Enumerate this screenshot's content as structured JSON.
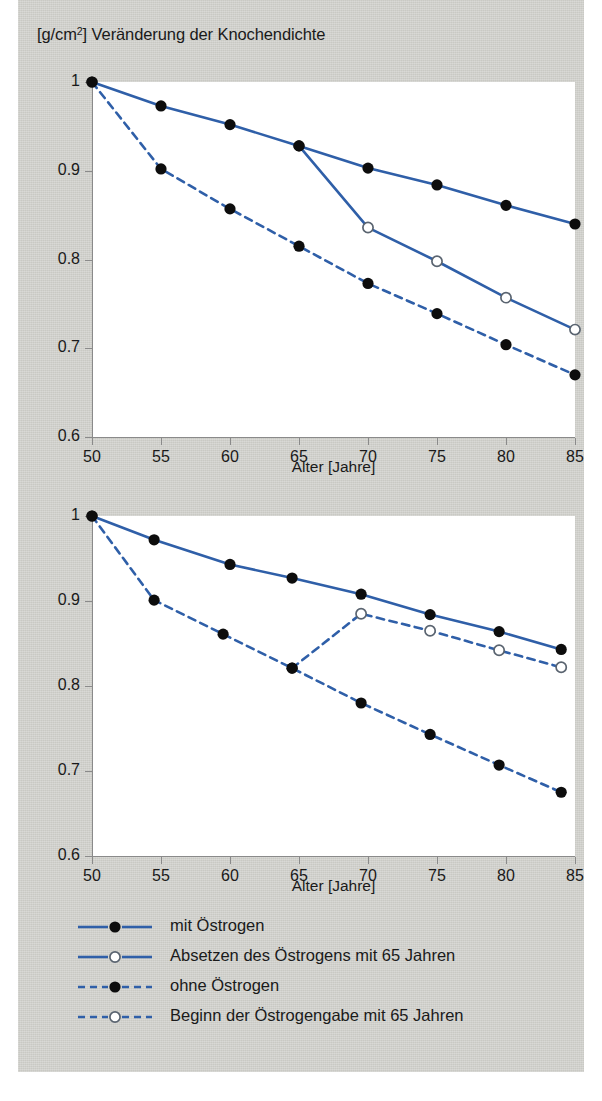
{
  "figure": {
    "title_prefix": "[g/cm",
    "title_sup": "2",
    "title_suffix": "] Veränderung der Knochendichte",
    "title_full": "[g/cm2] Veränderung der Knochendichte",
    "line_color": "#2f5fa8",
    "marker_fill_color": "#0d0d0d",
    "marker_open_color": "#ffffff",
    "panel_background": "#cdcdc8",
    "plot_background": "#ffffff",
    "axis_color": "#8a8a8a"
  },
  "legend": {
    "items": [
      {
        "label": "mit Östrogen",
        "style": "solid",
        "marker": "filled"
      },
      {
        "label": "Absetzen des Östrogens mit 65 Jahren",
        "style": "solid",
        "marker": "open"
      },
      {
        "label": "ohne Östrogen",
        "style": "dashed",
        "marker": "filled"
      },
      {
        "label": "Beginn der Östrogengabe mit 65 Jahren",
        "style": "dashed",
        "marker": "open"
      }
    ]
  },
  "chart_data": [
    {
      "id": "chart-top",
      "type": "line",
      "title": "[g/cm2] Veränderung der Knochendichte",
      "xlabel": "Alter [Jahre]",
      "ylabel": "[g/cm2]",
      "xlim": [
        50,
        85
      ],
      "ylim": [
        0.6,
        1.0
      ],
      "xticks": [
        50,
        55,
        60,
        65,
        70,
        75,
        80,
        85
      ],
      "xticklabels": [
        "50",
        "55",
        "60",
        "65",
        "70",
        "75",
        "80",
        "85"
      ],
      "yticks": [
        0.6,
        0.7,
        0.8,
        0.9,
        1.0
      ],
      "yticklabels": [
        "0.6",
        "0.7",
        "0.8",
        "0.9",
        "1"
      ],
      "grid": false,
      "legend_position": "below-figure",
      "series": [
        {
          "name": "mit Östrogen",
          "style": "solid",
          "marker": "filled",
          "x": [
            50,
            55,
            60,
            65,
            70,
            75,
            80,
            85
          ],
          "values": [
            1.0,
            0.973,
            0.952,
            0.928,
            0.903,
            0.884,
            0.861,
            0.84
          ]
        },
        {
          "name": "Absetzen des Östrogens mit 65 Jahren",
          "style": "solid",
          "marker": "open",
          "x": [
            65,
            70,
            75,
            80,
            85
          ],
          "values": [
            0.928,
            0.836,
            0.798,
            0.757,
            0.721
          ],
          "first_point_marker": "shared-filled"
        },
        {
          "name": "ohne Östrogen",
          "style": "dashed",
          "marker": "filled",
          "x": [
            50,
            55,
            60,
            65,
            70,
            75,
            80,
            85
          ],
          "values": [
            1.0,
            0.902,
            0.857,
            0.815,
            0.773,
            0.739,
            0.704,
            0.67
          ]
        }
      ]
    },
    {
      "id": "chart-bottom",
      "type": "line",
      "title": "",
      "xlabel": "Alter [Jahre]",
      "ylabel": "[g/cm2]",
      "xlim": [
        50,
        85
      ],
      "ylim": [
        0.6,
        1.0
      ],
      "xticks": [
        50,
        55,
        60,
        65,
        70,
        75,
        80,
        85
      ],
      "xticklabels": [
        "50",
        "55",
        "60",
        "65",
        "70",
        "75",
        "80",
        "85"
      ],
      "yticks": [
        0.6,
        0.7,
        0.8,
        0.9,
        1.0
      ],
      "yticklabels": [
        "0.6",
        "0.7",
        "0.8",
        "0.9",
        "1"
      ],
      "grid": false,
      "legend_position": "below-figure",
      "series": [
        {
          "name": "mit Östrogen",
          "style": "solid",
          "marker": "filled",
          "x": [
            50,
            54.5,
            60,
            64.5,
            69.5,
            74.5,
            79.5,
            84
          ],
          "values": [
            1.0,
            0.972,
            0.943,
            0.927,
            0.908,
            0.884,
            0.864,
            0.843
          ]
        },
        {
          "name": "ohne Östrogen",
          "style": "dashed",
          "marker": "filled",
          "x": [
            50,
            54.5,
            59.5,
            64.5,
            69.5,
            74.5,
            79.5,
            84
          ],
          "values": [
            1.0,
            0.901,
            0.861,
            0.821,
            0.78,
            0.743,
            0.707,
            0.675
          ]
        },
        {
          "name": "Beginn der Östrogengabe mit 65 Jahren",
          "style": "dashed",
          "marker": "open",
          "x": [
            64.5,
            69.5,
            74.5,
            79.5,
            84
          ],
          "values": [
            0.821,
            0.885,
            0.865,
            0.842,
            0.822
          ],
          "first_point_marker": "shared-filled"
        }
      ]
    }
  ]
}
